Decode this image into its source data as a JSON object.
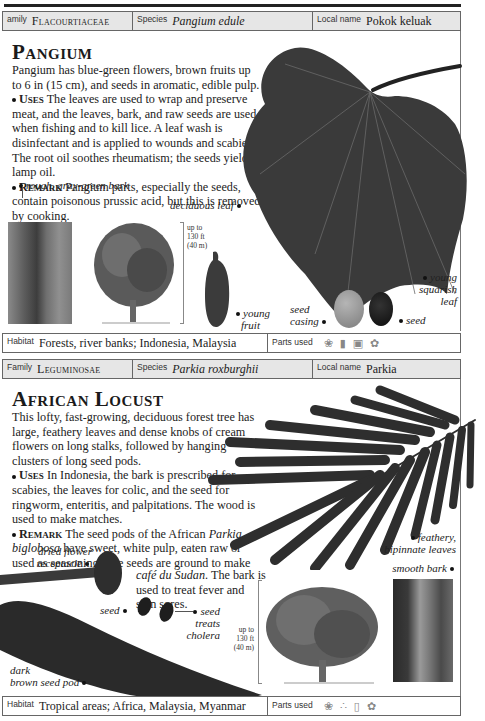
{
  "pangium": {
    "header": {
      "family_label": "amily",
      "family_value": "Flacourtiaceae",
      "species_label": "Species",
      "species_value": "Pangium edule",
      "local_label": "Local name",
      "local_value": "Pokok keluak"
    },
    "title": "Pangium",
    "intro": "Pangium has blue-green flowers, brown fruits up to 6 in (15 cm), and seeds in aromatic, edible pulp.",
    "uses_label": "Uses",
    "uses_text": "The leaves are used to wrap and preserve meat, and the leaves, bark, and raw seeds are used when fishing and to kill lice. A leaf wash is disinfectant and is applied to wounds and scabies. The root oil soothes rheumatism; the seeds yield a lamp oil.",
    "remark_label": "Remark",
    "remark_text": "Pangium parts, especially the seeds, contain poisonous prussic acid, but this is removed by cooking.",
    "captions": {
      "bark": "rough, gray-green bark",
      "leaf": "deciduous leaf",
      "fruit_1": "young",
      "fruit_2": "fruit",
      "casing_1": "seed",
      "casing_2": "casing",
      "seed": "seed",
      "young_leaf_1": "young",
      "young_leaf_2": "squarish",
      "young_leaf_3": "leaf"
    },
    "height_note": [
      "up to",
      "130 ft",
      "(40 m)"
    ],
    "footer": {
      "habitat_label": "Habitat",
      "habitat_value": "Forests, river banks; Indonesia, Malaysia",
      "parts_label": "Parts used",
      "parts_icons": [
        "leaf-icon",
        "bark-icon",
        "seed-icon",
        "flower-icon"
      ]
    }
  },
  "african_locust": {
    "header": {
      "family_label": "Family",
      "family_value": "Leguminosae",
      "species_label": "Species",
      "species_value": "Parkia roxburghii",
      "local_label": "Local name",
      "local_value": "Parkia"
    },
    "title": "African Locust",
    "intro": "This lofty, fast-growing, deciduous forest tree has large, feathery leaves and dense knobs of cream flowers on long stalks, followed by hanging clusters of long seed pods.",
    "uses_label": "Uses",
    "uses_text": "In Indonesia, the bark is prescribed for scabies, the leaves for colic, and the seed for ringworm, enteritis, and palpitations. The wood is used to make matches.",
    "remark_label": "Remark",
    "remark_text_1": "The seed pods of the African",
    "remark_italic": "Parkia biglobosa",
    "remark_text_2": "have sweet, white pulp, eaten raw or used as seasoning. The seeds are ground to make",
    "remark_italic_2": "café du Sudan",
    "remark_text_3": ". The bark is used to treat fever and skin sores.",
    "captions": {
      "receptacle_1": "dried flower",
      "receptacle_2": "receptacle",
      "seed_left": "seed",
      "seed_right_1": "seed",
      "seed_right_2": "treats",
      "seed_right_3": "cholera",
      "pod_1": "dark",
      "pod_2": "brown seed pod",
      "leaves_1": "feathery,",
      "leaves_2": "bipinnate leaves",
      "bark": "smooth bark"
    },
    "height_note": [
      "up to",
      "130 ft",
      "(40 m)"
    ],
    "footer": {
      "habitat_label": "Habitat",
      "habitat_value": "Tropical areas; Africa, Malaysia, Myanmar",
      "parts_label": "Parts used",
      "parts_icons": [
        "leaf-icon",
        "seed-icon",
        "bark-icon",
        "flower-icon"
      ]
    }
  }
}
